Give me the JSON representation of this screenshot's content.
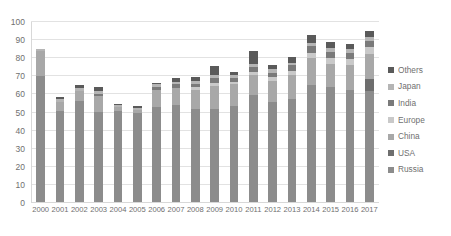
{
  "chart_data": {
    "type": "bar",
    "stacked": true,
    "title": "",
    "xlabel": "",
    "ylabel": "",
    "ylim": [
      0,
      100
    ],
    "ytick_step": 10,
    "yticks": [
      0,
      10,
      20,
      30,
      40,
      50,
      60,
      70,
      80,
      90,
      100
    ],
    "grid": true,
    "legend_position": "right",
    "categories": [
      "2000",
      "2001",
      "2002",
      "2003",
      "2004",
      "2005",
      "2006",
      "2007",
      "2008",
      "2009",
      "2010",
      "2011",
      "2012",
      "2013",
      "2014",
      "2015",
      "2016",
      "2017"
    ],
    "series": [
      {
        "name": "Russia",
        "color": "#8c8c8c",
        "values": [
          70.0,
          51.0,
          56.5,
          50.5,
          51.0,
          49.5,
          53.0,
          54.0,
          52.0,
          52.0,
          53.5,
          59.5,
          56.0,
          57.5,
          65.0,
          64.0,
          62.5,
          62.0
        ]
      },
      {
        "name": "USA",
        "color": "#6e6e6e",
        "values": [
          0.0,
          0.0,
          0.0,
          0.0,
          0.0,
          0.0,
          0.0,
          0.0,
          0.0,
          0.0,
          0.0,
          0.0,
          0.0,
          0.0,
          0.0,
          0.0,
          0.0,
          6.5
        ]
      },
      {
        "name": "China",
        "color": "#a8a8a8",
        "values": [
          14.0,
          5.0,
          5.5,
          8.5,
          2.0,
          2.0,
          9.5,
          9.5,
          10.5,
          12.5,
          12.0,
          11.0,
          11.5,
          13.0,
          15.0,
          13.0,
          13.5,
          14.0
        ]
      },
      {
        "name": "Europe",
        "color": "#c9c9c9",
        "values": [
          0.0,
          0.0,
          0.0,
          0.0,
          0.0,
          0.0,
          0.0,
          0.0,
          1.5,
          2.0,
          1.5,
          2.0,
          2.0,
          2.5,
          3.0,
          3.0,
          3.5,
          3.5
        ]
      },
      {
        "name": "India",
        "color": "#7a7a7a",
        "values": [
          0.0,
          0.0,
          0.0,
          1.5,
          0.0,
          0.0,
          1.5,
          2.0,
          2.0,
          2.5,
          2.0,
          2.5,
          2.5,
          3.0,
          3.5,
          3.5,
          3.5,
          3.5
        ]
      },
      {
        "name": "Japan",
        "color": "#b5b5b5",
        "values": [
          1.0,
          1.5,
          1.5,
          1.5,
          1.0,
          1.0,
          1.5,
          1.5,
          1.5,
          2.0,
          1.5,
          2.0,
          2.0,
          1.5,
          2.0,
          2.0,
          2.0,
          2.0
        ]
      },
      {
        "name": "Others",
        "color": "#5a5a5a",
        "values": [
          0.0,
          1.0,
          1.5,
          2.0,
          1.0,
          1.0,
          1.0,
          2.0,
          2.0,
          4.5,
          2.0,
          7.0,
          2.0,
          3.0,
          4.5,
          3.5,
          3.0,
          3.5
        ]
      }
    ]
  },
  "legend": {
    "items": [
      {
        "label": "Others",
        "color": "#5a5a5a"
      },
      {
        "label": "Japan",
        "color": "#b5b5b5"
      },
      {
        "label": "India",
        "color": "#7a7a7a"
      },
      {
        "label": "Europe",
        "color": "#c9c9c9"
      },
      {
        "label": "China",
        "color": "#a8a8a8"
      },
      {
        "label": "USA",
        "color": "#6e6e6e"
      },
      {
        "label": "Russia",
        "color": "#8c8c8c"
      }
    ]
  }
}
